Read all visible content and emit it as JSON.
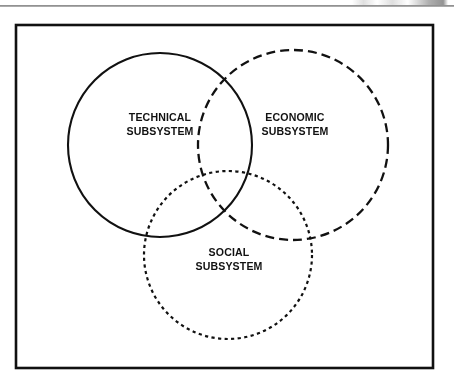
{
  "page": {
    "background_color": "#ffffff",
    "ink_color": "#111111",
    "header_rule_color": "#6f6f6f"
  },
  "figure": {
    "frame": {
      "x": 16,
      "y": 25,
      "width": 417,
      "height": 343,
      "stroke_color": "#111111"
    },
    "circles": [
      {
        "name": "technical-subsystem-circle",
        "cx": 160,
        "cy": 145,
        "r": 92,
        "line_style": "solid",
        "stroke_color": "#111111"
      },
      {
        "name": "economic-subsystem-circle",
        "cx": 293,
        "cy": 145,
        "r": 95,
        "line_style": "dashed",
        "stroke_color": "#111111"
      },
      {
        "name": "social-subsystem-circle",
        "cx": 228,
        "cy": 255,
        "r": 84,
        "line_style": "dotted",
        "stroke_color": "#111111"
      }
    ],
    "labels": {
      "technical": {
        "line1": "TECHNICAL",
        "line2": "SUBSYSTEM"
      },
      "economic": {
        "line1": "ECONOMIC",
        "line2": "SUBSYSTEM"
      },
      "social": {
        "line1": "SOCIAL",
        "line2": "SUBSYSTEM"
      }
    }
  }
}
